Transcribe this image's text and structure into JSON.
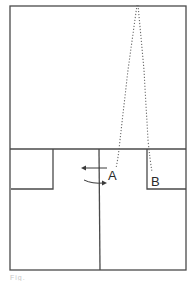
{
  "diagram": {
    "type": "floor-plan-path",
    "colors": {
      "line": "#4a4a4a",
      "dotted_path": "#6a6a6a",
      "label": "#2a2a2a",
      "background": "#ffffff"
    },
    "outer_frame": {
      "x": 10,
      "y": 6,
      "width": 176,
      "height": 264
    },
    "divider_horizontal_y": 149,
    "divider_vertical_x": 99,
    "inner_boxes": [
      {
        "name": "left-small-room",
        "x": 11,
        "y": 149,
        "width": 42,
        "height": 40
      },
      {
        "name": "right-small-room",
        "x": 147,
        "y": 149,
        "width": 39,
        "height": 40
      }
    ],
    "points": [
      {
        "id": "A",
        "label": "A",
        "x": 108,
        "y": 178
      },
      {
        "id": "B",
        "label": "B",
        "x": 153,
        "y": 181
      }
    ],
    "paths": [
      {
        "name": "path-to-A",
        "from": [
          137,
          5
        ],
        "to": [
          116,
          168
        ],
        "style": "dotted"
      },
      {
        "name": "path-to-B",
        "from": [
          138,
          5
        ],
        "to": [
          152,
          172
        ],
        "style": "dotted"
      }
    ],
    "arrows": [
      {
        "name": "arrow-left",
        "direction": "left"
      },
      {
        "name": "arrow-curved-right",
        "direction": "right-curved"
      }
    ],
    "caption": "Fig."
  }
}
